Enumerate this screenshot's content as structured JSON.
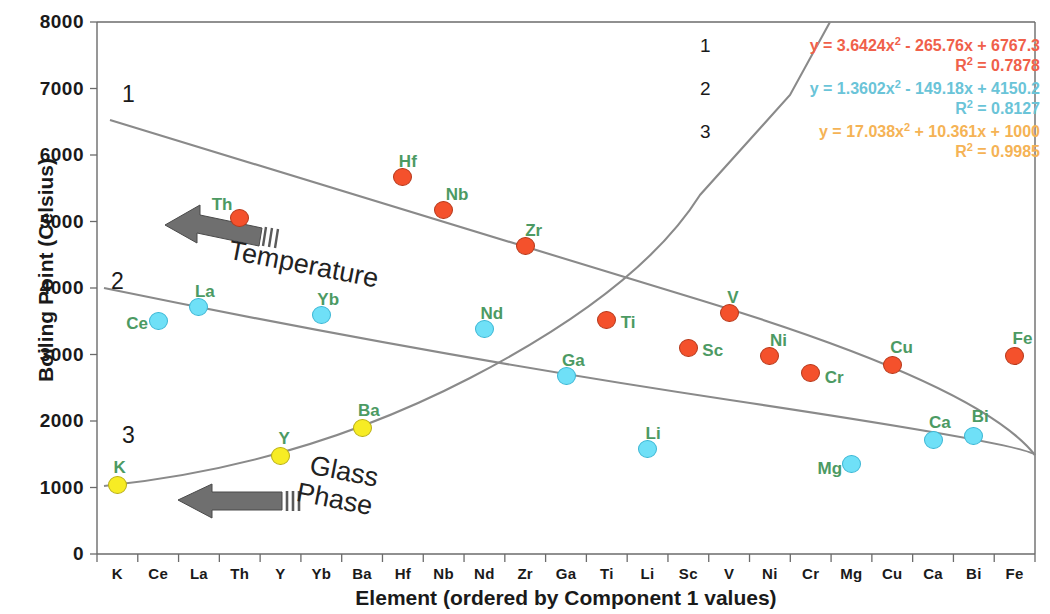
{
  "chart_data": {
    "type": "scatter",
    "title": "",
    "xlabel": "Element (ordered by Component 1 values)",
    "ylabel": "Boiling Point (Celsius)",
    "ylim": [
      0,
      8000
    ],
    "ytick_labels": [
      "8000",
      "7000",
      "6000",
      "5000",
      "4000",
      "3000",
      "2000",
      "1000",
      "0"
    ],
    "ytick_values": [
      8000,
      7000,
      6000,
      5000,
      4000,
      3000,
      2000,
      1000,
      0
    ],
    "grid": false,
    "categories": [
      "K",
      "Ce",
      "La",
      "Th",
      "Y",
      "Yb",
      "Ba",
      "Hf",
      "Nb",
      "Nd",
      "Zr",
      "Ga",
      "Ti",
      "Li",
      "Sc",
      "V",
      "Ni",
      "Cr",
      "Mg",
      "Cu",
      "Ca",
      "Bi",
      "Fe"
    ],
    "legend_position": "top-right",
    "series": [
      {
        "name": "Temperature",
        "color": "#f4512c",
        "points": [
          {
            "label": "Th",
            "x": 3,
            "y": 5050
          },
          {
            "label": "Hf",
            "x": 7,
            "y": 5670
          },
          {
            "label": "Nb",
            "x": 8,
            "y": 5180
          },
          {
            "label": "Zr",
            "x": 10,
            "y": 4630
          },
          {
            "label": "Ti",
            "x": 12,
            "y": 3520
          },
          {
            "label": "Sc",
            "x": 14,
            "y": 3100
          },
          {
            "label": "V",
            "x": 15,
            "y": 3630
          },
          {
            "label": "Ni",
            "x": 16,
            "y": 2980
          },
          {
            "label": "Cr",
            "x": 17,
            "y": 2720
          },
          {
            "label": "Cu",
            "x": 19,
            "y": 2840
          },
          {
            "label": "Fe",
            "x": 22,
            "y": 2980
          }
        ]
      },
      {
        "name": "Glass Phase",
        "color": "#6fe0f7",
        "points": [
          {
            "label": "Ce",
            "x": 1,
            "y": 3510
          },
          {
            "label": "La",
            "x": 2,
            "y": 3710
          },
          {
            "label": "Yb",
            "x": 5,
            "y": 3600
          },
          {
            "label": "Nd",
            "x": 9,
            "y": 3380
          },
          {
            "label": "Ga",
            "x": 11,
            "y": 2670
          },
          {
            "label": "Li",
            "x": 13,
            "y": 1580
          },
          {
            "label": "Mg",
            "x": 18,
            "y": 1350
          },
          {
            "label": "Ca",
            "x": 20,
            "y": 1710
          },
          {
            "label": "Bi",
            "x": 21,
            "y": 1780
          }
        ]
      },
      {
        "name": "Low",
        "color": "#f7ec24",
        "points": [
          {
            "label": "K",
            "x": 0,
            "y": 1040
          },
          {
            "label": "Y",
            "x": 4,
            "y": 1470
          },
          {
            "label": "Ba",
            "x": 6,
            "y": 1900
          }
        ]
      }
    ],
    "trendlines": [
      {
        "id": "1",
        "color": "#f0604a",
        "equation_a": "y = 3.6424x",
        "equation_b": " - 265.76x + 6767.3",
        "r2": "R",
        "r2_value": " = 0.7878",
        "coef": [
          3.6424,
          -265.76,
          6767.3
        ],
        "r2_num": 0.7878
      },
      {
        "id": "2",
        "color": "#6ac4d8",
        "equation_a": "y = 1.3602x",
        "equation_b": " - 149.18x + 4150.2",
        "r2": "R",
        "r2_value": " = 0.8127",
        "coef": [
          1.3602,
          -149.18,
          4150.2
        ],
        "r2_num": 0.8127
      },
      {
        "id": "3",
        "color": "#f5b355",
        "equation_a": "y = 17.038x",
        "equation_b": " + 10.361x + 1000",
        "r2": "R",
        "r2_value": " = 0.9985",
        "coef": [
          17.038,
          10.361,
          1000
        ],
        "r2_num": 0.9985
      }
    ],
    "curve_numbers": [
      {
        "id": "1",
        "left": 122,
        "top": 83
      },
      {
        "id": "2",
        "left": 111,
        "top": 270
      },
      {
        "id": "3",
        "left": 122,
        "top": 424
      }
    ],
    "annotations": [
      {
        "id": "temperature",
        "text": "Temperature"
      },
      {
        "id": "glass",
        "line1": "Glass",
        "line2": "Phase"
      }
    ],
    "arrows": [
      {
        "id": "temperature-arrow",
        "direction": "left"
      },
      {
        "id": "glass-arrow",
        "direction": "left"
      }
    ]
  }
}
